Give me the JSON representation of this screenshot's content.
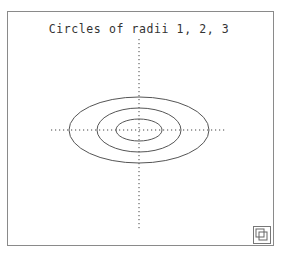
{
  "title": "Circles of radii 1, 2, 3",
  "figure": {
    "center": {
      "x": 139,
      "y": 130
    },
    "ellipses": [
      {
        "label": "radius 1",
        "rx": 23,
        "ry": 11
      },
      {
        "label": "radius 2",
        "rx": 42,
        "ry": 22
      },
      {
        "label": "radius 3",
        "rx": 70,
        "ry": 33
      }
    ],
    "axes": {
      "x_from": 51,
      "x_to": 227,
      "y_from": 39,
      "y_to": 230,
      "style": "dotted"
    },
    "stroke_color": "#555555",
    "axis_color": "#444444"
  },
  "controls": {
    "resize_icon": "resize-window-icon"
  }
}
